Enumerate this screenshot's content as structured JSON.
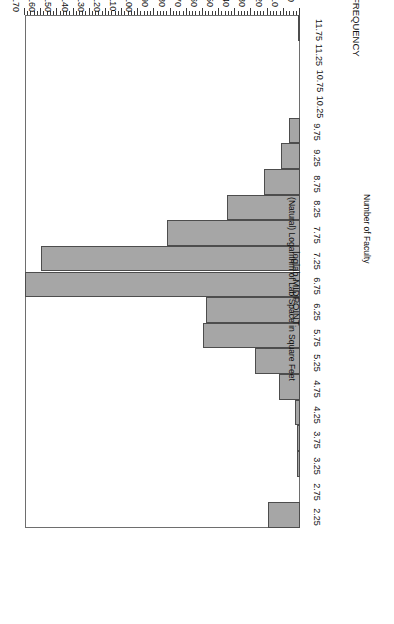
{
  "chart_data": {
    "type": "bar",
    "orientation": "horizontal-rotated-180",
    "title": "",
    "xlabel": "(Natural) Logarithm of Lab Space in Square Feet",
    "ylabel": "Number of Faculty",
    "category_axis_title": "loglab MIDPOINT",
    "value_axis_title": "FREQUENCY",
    "categories": [
      "2.25",
      "2.75",
      "3.25",
      "3.75",
      "4.25",
      "4.75",
      "5.25",
      "5.75",
      "6.25",
      "6.75",
      "7.25",
      "7.75",
      "8.25",
      "8.75",
      "9.25",
      "9.75",
      "10.25",
      "10.75",
      "11.25",
      "11.75"
    ],
    "values": [
      20,
      0,
      2,
      2,
      3,
      13,
      28,
      60,
      58,
      170,
      160,
      82,
      45,
      22,
      12,
      7,
      0,
      0,
      0,
      1
    ],
    "ylim": [
      0,
      170
    ],
    "value_ticks": [
      "0",
      "10",
      "20",
      "30",
      "40",
      "50",
      "60",
      "70",
      "80",
      "90",
      "100",
      "110",
      "120",
      "130",
      "140",
      "150",
      "160",
      "170"
    ],
    "value_tick_step": 10,
    "value_minor_tick_step": 2,
    "grid": false,
    "legend": null,
    "bar_color": "#a6a6a6",
    "bar_border_color": "#4d4d4d",
    "frame_color": "#6e6e6e"
  }
}
